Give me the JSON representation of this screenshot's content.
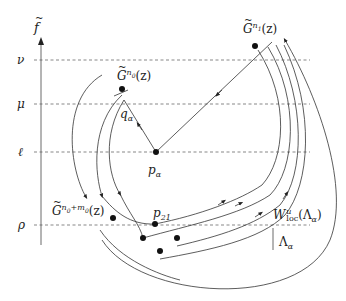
{
  "figure": {
    "axis": {
      "label_base": "f",
      "label_decoration": "tilde"
    },
    "levels": [
      {
        "name": "nu",
        "symbol": "ν",
        "y": 60
      },
      {
        "name": "mu",
        "symbol": "μ",
        "y": 104
      },
      {
        "name": "ell",
        "symbol": "ℓ",
        "y": 152
      },
      {
        "name": "rho",
        "symbol": "ρ",
        "y": 225
      }
    ],
    "labels": {
      "g_n1": {
        "base": "G",
        "sup": "n",
        "sup_sub": "1",
        "arg": "(z)"
      },
      "g_n0": {
        "base": "G",
        "sup": "n",
        "sup_sub": "0",
        "arg": "(z)"
      },
      "g_n0m0": {
        "base": "G",
        "sup": "n",
        "sup_sub": "0",
        "sup_plus": "+m",
        "sup_sub2": "0",
        "arg": "(z)"
      },
      "q_alpha": {
        "base": "q",
        "sub": "α"
      },
      "p_alpha": {
        "base": "p",
        "sub": "α"
      },
      "p_21": {
        "base": "p",
        "sub": "21"
      },
      "w_loc": {
        "base": "W",
        "sup": "u",
        "sub": "loc",
        "arg": "(Λ",
        "arg_sub": "α",
        "arg_close": ")"
      },
      "lambda_alpha": {
        "base": "Λ",
        "sub": "α"
      }
    },
    "colors": {
      "stroke": "#333333",
      "dash": "#555555",
      "point": "#111111"
    }
  }
}
